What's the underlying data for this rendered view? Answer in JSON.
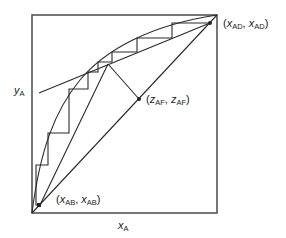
{
  "diagram": {
    "type": "McCabe-Thiele distillation stage construction",
    "axes": {
      "x_label": {
        "var": "x",
        "sub": "A"
      },
      "y_label": {
        "var": "y",
        "sub": "A"
      }
    },
    "points": {
      "distillate": {
        "text_open": "(",
        "var1": "x",
        "sub1": "AD",
        "sep": ", ",
        "var2": "x",
        "sub2": "AD",
        "text_close": ")"
      },
      "feed": {
        "text_open": "(",
        "var1": "z",
        "sub1": "AF",
        "sep": ", ",
        "var2": "z",
        "sub2": "AF",
        "text_close": ")"
      },
      "bottoms": {
        "text_open": "(",
        "var1": "x",
        "sub1": "AB",
        "sep": ", ",
        "var2": "x",
        "sub2": "AB",
        "text_close": ")"
      }
    },
    "colors": {
      "line": "#2a2a2a",
      "frame": "#555555",
      "background": "#ffffff"
    }
  }
}
